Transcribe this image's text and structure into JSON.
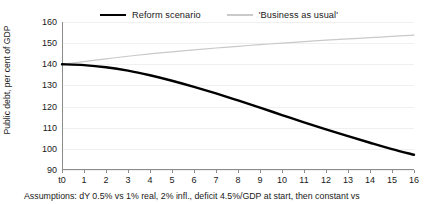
{
  "chart_data": {
    "type": "line",
    "title": "",
    "xlabel": "",
    "ylabel": "Public debt, per cent of GDP",
    "ylim": [
      90,
      160
    ],
    "yticks": [
      90,
      100,
      110,
      120,
      130,
      140,
      150,
      160
    ],
    "grid": true,
    "legend_position": "top-center",
    "categories": [
      "t0",
      "1",
      "2",
      "3",
      "4",
      "5",
      "6",
      "7",
      "8",
      "9",
      "10",
      "11",
      "12",
      "13",
      "14",
      "15",
      "16"
    ],
    "series": [
      {
        "name": "Reform scenario",
        "color": "#000000",
        "width": 2.4,
        "values": [
          140.0,
          139.6,
          138.6,
          137.0,
          134.8,
          132.2,
          129.3,
          126.2,
          122.9,
          119.5,
          116.0,
          112.5,
          109.2,
          106.0,
          102.9,
          99.9,
          97.2
        ]
      },
      {
        "name": "'Business as usual'",
        "color": "#c9c9c9",
        "width": 1.2,
        "values": [
          140.0,
          141.3,
          142.6,
          143.8,
          144.9,
          145.9,
          146.8,
          147.7,
          148.5,
          149.3,
          150.0,
          150.7,
          151.4,
          152.0,
          152.6,
          153.2,
          153.8
        ]
      }
    ],
    "annotations": {
      "footnote": "Assumptions: dY 0.5% vs 1% real, 2% infl., deficit 4.5%/GDP at start, then constant vs"
    }
  },
  "legend": {
    "items": [
      {
        "label": "Reform scenario"
      },
      {
        "label": "'Business as usual'"
      }
    ]
  }
}
